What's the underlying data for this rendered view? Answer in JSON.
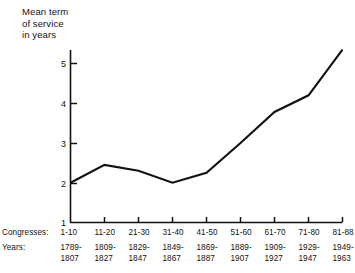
{
  "chart_data": {
    "type": "line",
    "title": "Mean term\nof service\nin years",
    "title_lines": [
      "Mean term",
      "of service",
      "in years"
    ],
    "xlabel": "",
    "ylabel": "Mean term of service in years",
    "ylim": [
      1,
      5.5
    ],
    "yticks": [
      1,
      2,
      3,
      4,
      5
    ],
    "ytick_labels": [
      "1",
      "2",
      "3",
      "4",
      "5"
    ],
    "grid": false,
    "legend": null,
    "categories": [
      "1-10",
      "11-20",
      "21-30",
      "31-40",
      "41-50",
      "51-60",
      "61-70",
      "71-80",
      "81-88"
    ],
    "values": [
      2.0,
      2.45,
      2.3,
      2.0,
      2.25,
      3.0,
      3.78,
      4.2,
      5.35
    ],
    "series": [
      {
        "name": "Mean term of service",
        "values": [
          2.0,
          2.45,
          2.3,
          2.0,
          2.25,
          3.0,
          3.78,
          4.2,
          5.35
        ]
      }
    ],
    "row_headers": {
      "congresses": "Congresses:",
      "years": "Years:"
    },
    "congresses": [
      "1-10",
      "11-20",
      "21-30",
      "31-40",
      "41-50",
      "51-60",
      "61-70",
      "71-80",
      "81-88"
    ],
    "years_start": [
      "1789-",
      "1809-",
      "1829-",
      "1849-",
      "1869-",
      "1889-",
      "1909-",
      "1929-",
      "1949-"
    ],
    "years_end": [
      "1807",
      "1827",
      "1847",
      "1867",
      "1887",
      "1907",
      "1927",
      "1947",
      "1963"
    ],
    "line_color": "#111111",
    "axis_color": "#111111"
  }
}
